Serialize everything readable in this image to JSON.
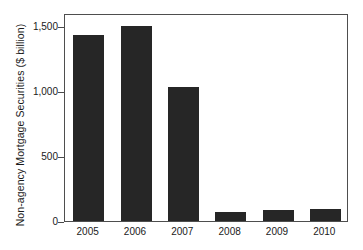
{
  "chart_data": {
    "type": "bar",
    "title": "",
    "xlabel": "",
    "ylabel": "Non-agency Mortgage Securities ($ billion)",
    "categories": [
      "2005",
      "2006",
      "2007",
      "2008",
      "2009",
      "2010"
    ],
    "values": [
      1430,
      1500,
      1030,
      70,
      85,
      90
    ],
    "ylim": [
      0,
      1600
    ],
    "yticks": [
      0,
      500,
      1000,
      1500
    ],
    "ytick_labels": [
      "0",
      "500",
      "1,000",
      "1,500"
    ],
    "grid": false,
    "legend": null,
    "bar_color": "#262626",
    "axis_color": "#4e4e4e",
    "background": "#ffffff"
  },
  "axes": {
    "y_title": "Non-agency Mortgage Securities ($ billion)"
  }
}
